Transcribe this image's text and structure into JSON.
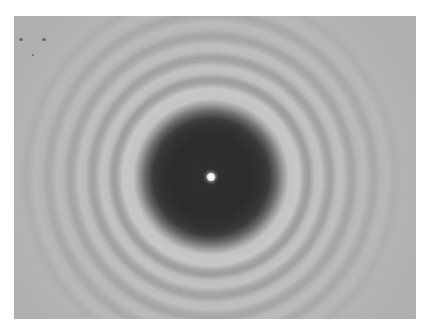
{
  "image": {
    "subject": "diffraction pattern with bright central spot",
    "description": "Grayscale photograph of concentric light and dark rings around a dark circular disc with a bright central spot",
    "colors": {
      "background": "#b3b3b3",
      "disc": "#2c2c2c",
      "center_spot": "#f2f2f2",
      "frame": "#ffffff"
    }
  }
}
